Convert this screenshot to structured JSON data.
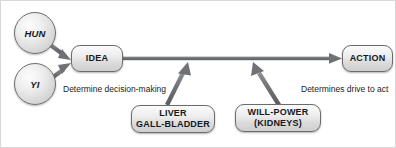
{
  "diagram": {
    "stroke_color": "#6f7174",
    "node_border_color": "#6b6b6b",
    "text_color": "#15181c",
    "nodes": {
      "hun": {
        "label": "HUN",
        "shape": "circle"
      },
      "yi": {
        "label": "YI",
        "shape": "circle"
      },
      "idea": {
        "label": "IDEA",
        "shape": "rounded-box"
      },
      "action": {
        "label": "ACTION",
        "shape": "rounded-box"
      },
      "liver": {
        "line1": "LIVER",
        "line2": "GALL-BLADDER",
        "shape": "rounded-box"
      },
      "willpower": {
        "line1": "WILL-POWER",
        "line2": "(KIDNEYS)",
        "shape": "rounded-box"
      }
    },
    "captions": {
      "decision": "Determine decision-making",
      "drive": "Determines drive to act"
    },
    "arrows": [
      {
        "name": "hun-to-idea",
        "from": "hun",
        "to": "idea"
      },
      {
        "name": "yi-to-idea",
        "from": "yi",
        "to": "idea"
      },
      {
        "name": "idea-to-action",
        "from": "idea",
        "to": "action"
      },
      {
        "name": "liver-to-flow",
        "from": "liver",
        "to": "idea-action-flow"
      },
      {
        "name": "willpower-to-flow",
        "from": "willpower",
        "to": "idea-action-flow"
      }
    ]
  }
}
